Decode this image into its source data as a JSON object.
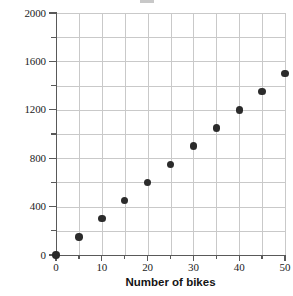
{
  "chart_data": {
    "type": "scatter",
    "title": "",
    "xlabel": "Number of bikes",
    "ylabel": "Rental fee (dollars)",
    "xlim": [
      0,
      50
    ],
    "ylim": [
      0,
      2000
    ],
    "grid": true,
    "legend": "none",
    "x_major_ticks": [
      0,
      10,
      20,
      30,
      40,
      50
    ],
    "x_minor_ticks": [
      5,
      15,
      25,
      35,
      45
    ],
    "x_tick_labels": [
      "0",
      "10",
      "20",
      "30",
      "40",
      "50"
    ],
    "y_major_ticks": [
      0,
      400,
      800,
      1200,
      1600,
      2000
    ],
    "y_minor_ticks": [
      200,
      600,
      1000,
      1400,
      1800
    ],
    "y_tick_labels": [
      "0",
      "400",
      "800",
      "1200",
      "1600",
      "2000"
    ],
    "x": [
      0,
      5,
      10,
      15,
      20,
      25,
      30,
      35,
      40,
      45,
      50
    ],
    "y": [
      0,
      150,
      300,
      450,
      600,
      750,
      900,
      1050,
      1200,
      1350,
      1500
    ],
    "points": [
      {
        "x": 0,
        "y": 0
      },
      {
        "x": 5,
        "y": 150
      },
      {
        "x": 10,
        "y": 300
      },
      {
        "x": 15,
        "y": 450
      },
      {
        "x": 20,
        "y": 600
      },
      {
        "x": 25,
        "y": 750
      },
      {
        "x": 30,
        "y": 900
      },
      {
        "x": 35,
        "y": 1050
      },
      {
        "x": 40,
        "y": 1200
      },
      {
        "x": 45,
        "y": 1350
      },
      {
        "x": 50,
        "y": 1500
      }
    ],
    "marker_color": "#2b2b2b",
    "grid_color": "#c9c9c9",
    "axis_color": "#595959"
  }
}
